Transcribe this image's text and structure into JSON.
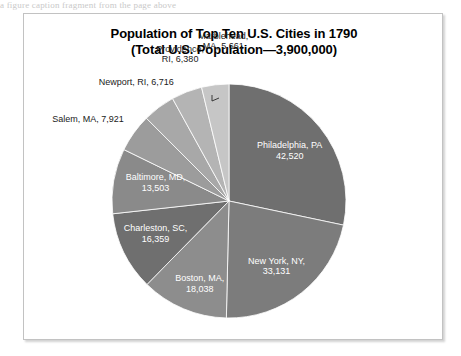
{
  "page": {
    "cropped_text_above": "a figure caption fragment from the page above"
  },
  "chart_data": {
    "type": "pie",
    "title": "Population of Top Ten U.S. Cities in 1790",
    "subtitle": "(Total U.S. Population—3,900,000)",
    "total_us_population": "3,900,000",
    "xlabel": "",
    "ylabel": "",
    "legend": "none",
    "grid": false,
    "start_angle_deg": 0,
    "direction": "clockwise",
    "categories": [
      "Philadelphia, PA",
      "New York, NY",
      "Boston, MA",
      "Charleston, SC",
      "Baltimore, MD",
      "Salem, MA",
      "Newport, RI",
      "Providence, RI",
      "Marblehead, MA"
    ],
    "values": [
      42520,
      33131,
      18038,
      16359,
      13503,
      7921,
      6716,
      6380,
      5661
    ],
    "value_labels": [
      "42,520",
      "33,131",
      "18,038",
      "16,359",
      "13,503",
      "7,921",
      "6,716",
      "6,380",
      "5,661"
    ],
    "colors": [
      "#6f6f6f",
      "#7c7c7c",
      "#8d8d8d",
      "#6f6f6f",
      "#8a8a8a",
      "#9c9c9c",
      "#a8a8a8",
      "#b4b4b4",
      "#c6c6c6"
    ],
    "slices": [
      {
        "name": "Philadelphia, PA",
        "value": 42520,
        "value_label": "42,520",
        "label_line1": "Philadelphia, PA",
        "label_line2": "42,520",
        "color": "#6f6f6f",
        "label_position": "inside",
        "leader": false
      },
      {
        "name": "New York, NY",
        "value": 33131,
        "value_label": "33,131",
        "label_line1": "New York, NY,",
        "label_line2": "33,131",
        "color": "#7c7c7c",
        "label_position": "inside",
        "leader": false
      },
      {
        "name": "Boston, MA",
        "value": 18038,
        "value_label": "18,038",
        "label_line1": "Boston, MA,",
        "label_line2": "18,038",
        "color": "#8d8d8d",
        "label_position": "inside",
        "leader": false
      },
      {
        "name": "Charleston, SC",
        "value": 16359,
        "value_label": "16,359",
        "label_line1": "Charleston, SC,",
        "label_line2": "16,359",
        "color": "#6f6f6f",
        "label_position": "inside",
        "leader": false
      },
      {
        "name": "Baltimore, MD",
        "value": 13503,
        "value_label": "13,503",
        "label_line1": "Baltimore, MD,",
        "label_line2": "13,503",
        "color": "#8a8a8a",
        "label_position": "inside",
        "leader": false
      },
      {
        "name": "Salem, MA",
        "value": 7921,
        "value_label": "7,921",
        "label_line1": "Salem, MA, 7,921",
        "label_line2": "",
        "color": "#9c9c9c",
        "label_position": "outside",
        "leader": false
      },
      {
        "name": "Newport, RI",
        "value": 6716,
        "value_label": "6,716",
        "label_line1": "Newport, RI, 6,716",
        "label_line2": "",
        "color": "#a8a8a8",
        "label_position": "outside",
        "leader": false
      },
      {
        "name": "Providence, RI",
        "value": 6380,
        "value_label": "6,380",
        "label_line1": "Providence,",
        "label_line2": "RI, 6,380",
        "color": "#b4b4b4",
        "label_position": "outside",
        "leader": true
      },
      {
        "name": "Marblehead, MA",
        "value": 5661,
        "value_label": "5,661",
        "label_line1": "Marblehead,",
        "label_line2": "MA, 5,661",
        "color": "#c6c6c6",
        "label_position": "outside",
        "leader": false
      }
    ]
  }
}
